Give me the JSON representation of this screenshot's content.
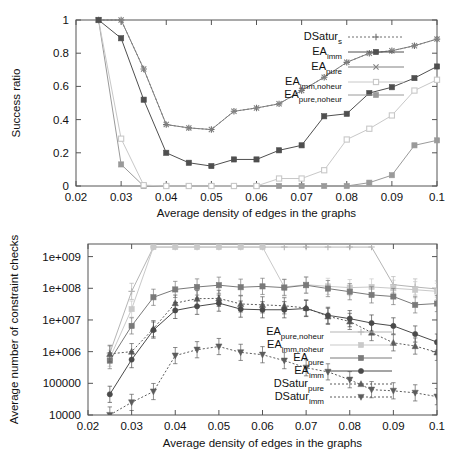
{
  "figure": {
    "background": "#ffffff",
    "panel_count": 2
  },
  "chart_data": [
    {
      "id": "success-ratio",
      "type": "line",
      "title": "",
      "xlabel": "Average density of edges in the graphs",
      "ylabel": "Success ratio",
      "xlim": [
        0.02,
        0.1
      ],
      "ylim": [
        0,
        1
      ],
      "xticks": [
        0.02,
        0.03,
        0.04,
        0.05,
        0.06,
        0.07,
        0.08,
        0.09,
        0.1
      ],
      "xtick_labels": [
        "0.02",
        "0.03",
        "0.04",
        "0.05",
        "0.06",
        "0.07",
        "0.08",
        "0.09",
        "0.1"
      ],
      "yticks": [
        0,
        0.2,
        0.4,
        0.6,
        0.8,
        1
      ],
      "ytick_labels": [
        "0",
        "0.2",
        "0.4",
        "0.6",
        "0.8",
        "1"
      ],
      "grid": false,
      "legend_position": "upper-right",
      "x": [
        0.025,
        0.03,
        0.035,
        0.04,
        0.045,
        0.05,
        0.055,
        0.06,
        0.065,
        0.07,
        0.075,
        0.08,
        0.085,
        0.09,
        0.095,
        0.1
      ],
      "series": [
        {
          "name": "DSaturs",
          "label_main": "DSatur",
          "label_sub": "s",
          "marker": "plus",
          "color": "#6e6e6e",
          "dash": "2,2",
          "values": [
            1.0,
            1.0,
            0.705,
            0.37,
            0.35,
            0.34,
            0.45,
            0.47,
            0.495,
            0.575,
            0.655,
            0.745,
            0.8,
            0.815,
            0.845,
            0.885
          ]
        },
        {
          "name": "EA_imm",
          "label_main": "EA",
          "label_sub": "imm",
          "marker": "filled-square",
          "color": "#4f4f4f",
          "dash": "none",
          "values": [
            1.0,
            0.89,
            0.52,
            0.2,
            0.14,
            0.12,
            0.16,
            0.16,
            0.215,
            0.245,
            0.42,
            0.435,
            0.56,
            0.595,
            0.65,
            0.72
          ]
        },
        {
          "name": "EA_pure",
          "label_main": "EA",
          "label_sub": "pure",
          "marker": "x",
          "color": "#808080",
          "dash": "none",
          "values": [
            1.0,
            1.0,
            0.705,
            0.37,
            0.35,
            0.34,
            0.45,
            0.47,
            0.495,
            0.575,
            0.655,
            0.745,
            0.8,
            0.815,
            0.845,
            0.885
          ]
        },
        {
          "name": "EA_imm,noheur",
          "label_main": "EA",
          "label_sub": "imm,noheur",
          "marker": "open-square",
          "color": "#c8c8c8",
          "dash": "none",
          "values": [
            1.0,
            0.285,
            0.005,
            0.0,
            0.0,
            0.0,
            0.0,
            0.0,
            0.045,
            0.045,
            0.095,
            0.28,
            0.345,
            0.425,
            0.575,
            0.64
          ]
        },
        {
          "name": "EA_pure,noheur",
          "label_main": "EA",
          "label_sub": "pure,noheur",
          "marker": "filled-square",
          "color": "#9a9a9a",
          "dash": "none",
          "values": [
            1.0,
            0.13,
            0.0,
            0.0,
            0.0,
            0.0,
            0.0,
            0.0,
            0.0,
            0.0,
            0.0,
            0.0,
            0.02,
            0.065,
            0.245,
            0.275
          ]
        }
      ]
    },
    {
      "id": "constraint-checks",
      "type": "line",
      "title": "",
      "xlabel": "Average density of edges in the graphs",
      "ylabel": "Average number of constraint checks",
      "yscale": "log",
      "xlim": [
        0.02,
        0.1
      ],
      "ylim": [
        10000,
        2500000000
      ],
      "xticks": [
        0.02,
        0.03,
        0.04,
        0.05,
        0.06,
        0.07,
        0.08,
        0.09,
        0.1
      ],
      "xtick_labels": [
        "0.02",
        "0.03",
        "0.04",
        "0.05",
        "0.06",
        "0.07",
        "0.08",
        "0.09",
        "0.1"
      ],
      "yticks": [
        10000,
        100000,
        1000000,
        10000000,
        100000000,
        1000000000
      ],
      "ytick_labels": [
        "10000",
        "100000",
        "1e+006",
        "1e+007",
        "1e+008",
        "1e+009"
      ],
      "grid": false,
      "legend_position": "lower-right",
      "x": [
        0.025,
        0.03,
        0.035,
        0.04,
        0.045,
        0.05,
        0.055,
        0.06,
        0.065,
        0.07,
        0.075,
        0.08,
        0.085,
        0.09,
        0.095,
        0.1
      ],
      "series": [
        {
          "name": "EA_pure,noheur",
          "label_main": "EA",
          "label_sub": "pure,noheur",
          "marker": "plus",
          "color": "#b5b5b5",
          "dash": "none",
          "values": [
            900000,
            80000000,
            2000000000,
            2000000000,
            2000000000,
            2000000000,
            2000000000,
            2000000000,
            2000000000,
            2000000000,
            2000000000,
            2000000000,
            2000000000,
            130000000,
            110000000,
            95000000
          ]
        },
        {
          "name": "EA_imm,noheur",
          "label_main": "EA",
          "label_sub": "imm,noheur",
          "marker": "filled-square",
          "color": "#c9c9c9",
          "dash": "none",
          "values": [
            620000,
            22000000,
            2000000000,
            2000000000,
            2000000000,
            2000000000,
            2000000000,
            2000000000,
            110000000,
            130000000,
            115000000,
            105000000,
            110000000,
            100000000,
            90000000,
            80000000
          ]
        },
        {
          "name": "EA_pure",
          "label_main": "EA",
          "label_sub": "pure",
          "marker": "filled-square",
          "color": "#7a7a7a",
          "dash": "none",
          "values": [
            520000,
            6500000,
            52000000,
            92000000,
            110000000,
            125000000,
            108000000,
            115000000,
            105000000,
            125000000,
            98000000,
            78000000,
            62000000,
            55000000,
            30000000,
            33000000
          ]
        },
        {
          "name": "EA_imm",
          "label_main": "EA",
          "label_sub": "imm",
          "marker": "filled-circle",
          "color": "#4a4a4a",
          "dash": "none",
          "values": [
            45000,
            560000,
            4800000,
            20000000,
            27000000,
            34000000,
            22000000,
            21000000,
            21000000,
            23000000,
            14000000,
            11000000,
            8000000,
            6500000,
            3600000,
            2000000
          ]
        },
        {
          "name": "DSatur_pure",
          "label_main": "DSatur",
          "label_sub": "pure",
          "marker": "triangle-up",
          "color": "#5c5c5c",
          "dash": "2,2",
          "values": [
            850000,
            1000000,
            5300000,
            34000000,
            47000000,
            48000000,
            32000000,
            30000000,
            28000000,
            24000000,
            13000000,
            9000000,
            4000000,
            1900000,
            1500000,
            950000
          ]
        },
        {
          "name": "DSatur_imm",
          "label_main": "DSatur",
          "label_sub": "imm",
          "marker": "triangle-down",
          "color": "#5c5c5c",
          "dash": "2,2",
          "values": [
            10000,
            25000,
            55000,
            750000,
            1150000,
            1450000,
            950000,
            800000,
            520000,
            310000,
            230000,
            130000,
            63000,
            58000,
            50000,
            38000
          ]
        }
      ],
      "error_bars": true
    }
  ]
}
